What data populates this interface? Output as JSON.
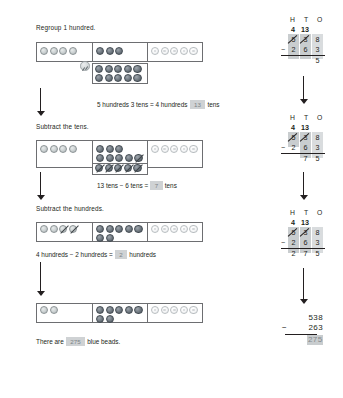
{
  "document": {
    "type": "math-worksheet",
    "topic": "Subtraction with regrouping using place-value beads",
    "problem": "538 - 263"
  },
  "steps": [
    {
      "id": "regroup-hundred",
      "title": "Regroup 1 hundred.",
      "equation_prefix": "5 hundreds 3 tens = 4 hundreds",
      "equation_answer": "13",
      "equation_suffix": "tens",
      "beads": {
        "hundreds": 4,
        "hundreds_crossed": 0,
        "tens_in_frame": 3,
        "tens_crossed": 0,
        "tens_extra_rows": [
          5,
          5
        ],
        "ones": 5
      }
    },
    {
      "id": "subtract-tens",
      "title": "Subtract the tens.",
      "equation_prefix": "13 tens − 6 tens =",
      "equation_answer": "7",
      "equation_suffix": "tens",
      "beads": {
        "hundreds": 4,
        "hundreds_crossed": 0,
        "tens_in_frame": 3,
        "tens_row2": 5,
        "tens_row2_crossed": 1,
        "tens_extra_rows": [
          5
        ],
        "tens_extra_crossed": 5,
        "ones": 5
      }
    },
    {
      "id": "subtract-hundreds",
      "title": "Subtract the hundreds.",
      "equation_prefix": "4 hundreds − 2 hundreds =",
      "equation_answer": "2",
      "equation_suffix": "hundreds",
      "beads": {
        "hundreds": 4,
        "hundreds_crossed": 2,
        "tens_row1": 5,
        "tens_row2": 2,
        "ones": 5
      }
    },
    {
      "id": "result",
      "title": "",
      "equation_prefix": "There are",
      "equation_answer": "275",
      "equation_suffix": "blue beads.",
      "beads": {
        "hundreds": 2,
        "tens_row1": 5,
        "tens_row2": 2,
        "ones": 5
      }
    }
  ],
  "vertical": {
    "headers": "H  T  O",
    "header_letters": [
      "H",
      "T",
      "O"
    ],
    "blocks": [
      {
        "id": "block-1",
        "regroup_top": "4  13",
        "regroup_hundreds": "4",
        "regroup_tens": "13",
        "minuend": [
          "5",
          "3",
          "8"
        ],
        "subtrahend": [
          "2",
          "6",
          "3"
        ],
        "difference": [
          "",
          "",
          "5"
        ],
        "minus_sign": "−"
      },
      {
        "id": "block-2",
        "regroup_top": "4  13",
        "regroup_hundreds": "4",
        "regroup_tens": "13",
        "minuend": [
          "5",
          "3",
          "8"
        ],
        "subtrahend": [
          "2",
          "6",
          "3"
        ],
        "difference": [
          "",
          "7",
          "5"
        ],
        "minus_sign": "−"
      },
      {
        "id": "block-3",
        "regroup_top": "4  13",
        "regroup_hundreds": "4",
        "regroup_tens": "13",
        "minuend": [
          "5",
          "3",
          "8"
        ],
        "subtrahend": [
          "2",
          "6",
          "3"
        ],
        "difference": [
          "2",
          "7",
          "5"
        ],
        "minus_sign": "−"
      }
    ],
    "final": {
      "minuend": "538",
      "subtrahend": "263",
      "minus_sign": "−",
      "answer": "275"
    }
  },
  "colors": {
    "ink": "#231f20",
    "frame": "#6d6e71",
    "answer_box": "#cfd2d4",
    "answer_text": "#7c8387",
    "bead_hundreds": "#c9cfd0",
    "bead_tens": "#6e777f",
    "bead_ones": "#f4f5f6"
  }
}
